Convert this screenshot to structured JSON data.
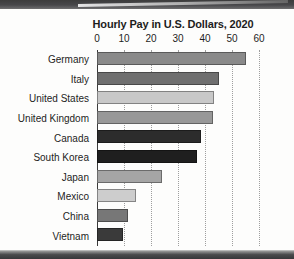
{
  "chart_data": {
    "type": "bar",
    "orientation": "horizontal",
    "title": "Hourly Pay in U.S. Dollars, 2020",
    "xlabel": "",
    "ylabel": "",
    "xlim": [
      0,
      60
    ],
    "xticks": [
      0,
      10,
      20,
      30,
      40,
      50,
      60
    ],
    "grid": "vertical-dotted",
    "legend": "none",
    "categories": [
      "Germany",
      "Italy",
      "United States",
      "United Kingdom",
      "Canada",
      "South Korea",
      "Japan",
      "Mexico",
      "China",
      "Vietnam"
    ],
    "values": [
      55.2,
      45.0,
      43.5,
      43.0,
      38.5,
      37.0,
      24.0,
      14.5,
      11.5,
      9.5
    ],
    "bar_colors": [
      "#8a8a8a",
      "#6f6f6f",
      "#c8c8c8",
      "#989898",
      "#2c2c2c",
      "#1f1f1f",
      "#a5a5a5",
      "#cdcdcd",
      "#777777",
      "#3a3a3a"
    ]
  },
  "colors": {
    "text": "#1d1d1d",
    "axis": "#3a3a3a",
    "gridline": "#9e9e9e",
    "page_background": "#fdfdfc"
  }
}
